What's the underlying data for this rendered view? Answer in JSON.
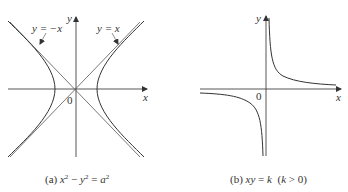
{
  "figure_a": {
    "caption_prefix": "(a) ",
    "caption_x": "x",
    "caption_minus": " − ",
    "caption_y": "y",
    "caption_eq": " = ",
    "caption_a": "a",
    "caption_exp": "2",
    "axis_x_label": "x",
    "axis_y_label": "y",
    "origin_label": "0",
    "asymptote_neg_label": "y = −x",
    "asymptote_pos_label": "y = x",
    "equation": "x² − y² = a²",
    "curve_color": "#333333"
  },
  "figure_b": {
    "caption_prefix": "(b) ",
    "caption_xy": "xy",
    "caption_eq": " = ",
    "caption_k": "k",
    "caption_cond_open": "  (",
    "caption_cond_k": "k",
    "caption_cond_rest": " > 0)",
    "axis_x_label": "x",
    "axis_y_label": "y",
    "origin_label": "0",
    "equation": "xy = k (k > 0)",
    "curve_color": "#333333"
  }
}
